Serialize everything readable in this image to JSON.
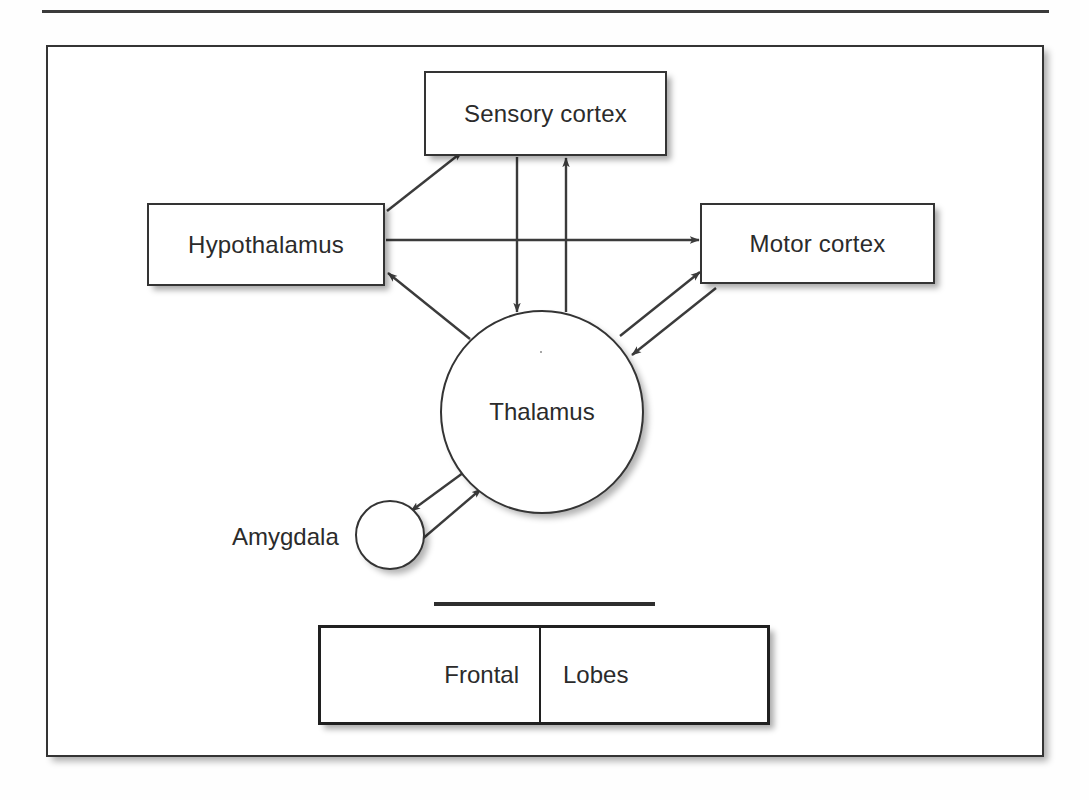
{
  "figure": {
    "type": "node-link-diagram",
    "background_color": "#ffffff",
    "line_color": "#3b3b3b",
    "text_color": "#2b2b2b"
  },
  "rules": {
    "top_rule_name": "top-horizontal-rule",
    "mid_rule_name": "mid-horizontal-rule"
  },
  "nodes": {
    "sensory_cortex": {
      "label": "Sensory cortex",
      "shape": "rectangle"
    },
    "hypothalamus": {
      "label": "Hypothalamus",
      "shape": "rectangle"
    },
    "motor_cortex": {
      "label": "Motor cortex",
      "shape": "rectangle"
    },
    "thalamus": {
      "label": "Thalamus",
      "shape": "circle"
    },
    "amygdala": {
      "label": "Amygdala",
      "shape": "circle"
    }
  },
  "lobes_table": {
    "cells": [
      {
        "label": "Frontal"
      },
      {
        "label": "Lobes"
      }
    ]
  },
  "connections": [
    {
      "from": "hypothalamus",
      "to": "sensory_cortex",
      "direction": "one-way"
    },
    {
      "from": "hypothalamus",
      "to": "motor_cortex",
      "direction": "one-way"
    },
    {
      "from": "sensory_cortex",
      "to": "thalamus",
      "direction": "one-way"
    },
    {
      "from": "thalamus",
      "to": "sensory_cortex",
      "direction": "one-way"
    },
    {
      "from": "thalamus",
      "to": "hypothalamus",
      "direction": "one-way"
    },
    {
      "from": "thalamus",
      "to": "motor_cortex",
      "direction": "one-way"
    },
    {
      "from": "motor_cortex",
      "to": "thalamus",
      "direction": "one-way"
    },
    {
      "from": "thalamus",
      "to": "amygdala",
      "direction": "one-way"
    },
    {
      "from": "amygdala",
      "to": "thalamus",
      "direction": "one-way"
    }
  ]
}
